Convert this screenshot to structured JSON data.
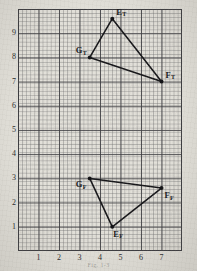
{
  "figure": {
    "caption": "Fig. 1-3",
    "paper_color": "#e2e0d9",
    "grid_color": "#3e3e42",
    "ink_color": "#17171a"
  },
  "axes": {
    "x_ticks": [
      "1",
      "2",
      "3",
      "4",
      "5",
      "6",
      "7"
    ],
    "y_ticks": [
      "9",
      "8",
      "7",
      "6",
      "5",
      "4",
      "3",
      "2",
      "1"
    ],
    "xlim": [
      0,
      8
    ],
    "ylim": [
      0,
      10
    ],
    "minor_divisions_per_unit": 5
  },
  "chart_data": {
    "type": "scatter",
    "title": "",
    "xlabel": "",
    "ylabel": "",
    "xlim": [
      0,
      8
    ],
    "ylim": [
      0,
      10
    ],
    "grid": true,
    "legend": "none",
    "series": [
      {
        "name": "Triangle T",
        "closed": true,
        "points": [
          {
            "label": "E",
            "sub": "T",
            "x": 4.6,
            "y": 9.6,
            "label_dx": 4,
            "label_dy": -11
          },
          {
            "label": "F",
            "sub": "T",
            "x": 7.0,
            "y": 7.0,
            "label_dx": 4,
            "label_dy": -11
          },
          {
            "label": "G",
            "sub": "T",
            "x": 3.5,
            "y": 8.0,
            "label_dx": -14,
            "label_dy": -11
          }
        ]
      },
      {
        "name": "Triangle F",
        "closed": true,
        "points": [
          {
            "label": "G",
            "sub": "F",
            "x": 3.5,
            "y": 3.0,
            "label_dx": -14,
            "label_dy": 2
          },
          {
            "label": "F",
            "sub": "F",
            "x": 7.0,
            "y": 2.6,
            "label_dx": 3,
            "label_dy": 3
          },
          {
            "label": "E",
            "sub": "F",
            "x": 4.6,
            "y": 1.0,
            "label_dx": 1,
            "label_dy": 3
          }
        ]
      }
    ]
  }
}
